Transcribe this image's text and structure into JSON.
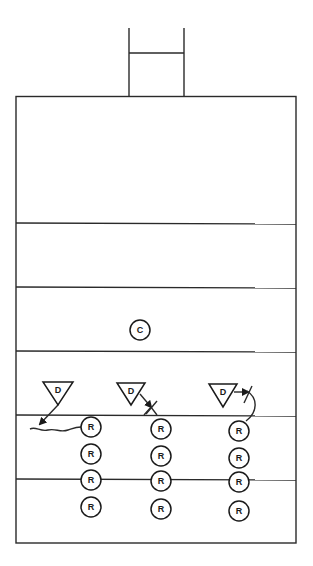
{
  "diagram": {
    "type": "football-drill-diagram",
    "goalpost": {
      "left_x": 129,
      "right_x": 184,
      "top_y": 28,
      "crossbar_y": 53,
      "base_y": 96
    },
    "field": {
      "x": 16,
      "y": 96,
      "width": 280,
      "height": 447
    },
    "yard_lines_y": [
      223,
      287,
      351,
      415,
      479
    ],
    "coach": {
      "label": "C",
      "x": 140,
      "y": 330
    },
    "defenders": [
      {
        "label": "D",
        "x": 58,
        "top_y": 382,
        "half_width": 15,
        "apex_y": 405,
        "technique": "dive-under"
      },
      {
        "label": "D",
        "x": 131,
        "top_y": 383,
        "half_width": 14,
        "apex_y": 405,
        "technique": "block-contact"
      },
      {
        "label": "D",
        "x": 223,
        "top_y": 384,
        "half_width": 14,
        "apex_y": 407,
        "technique": "loop-around"
      }
    ],
    "runner_columns": [
      {
        "x": 91,
        "rows": [
          {
            "label": "R",
            "y": 427
          },
          {
            "label": "R",
            "y": 454
          },
          {
            "label": "R",
            "y": 480
          },
          {
            "label": "R",
            "y": 507
          }
        ]
      },
      {
        "x": 161,
        "rows": [
          {
            "label": "R",
            "y": 429
          },
          {
            "label": "R",
            "y": 456
          },
          {
            "label": "R",
            "y": 481
          },
          {
            "label": "R",
            "y": 509
          }
        ]
      },
      {
        "x": 239,
        "rows": [
          {
            "label": "R",
            "y": 431
          },
          {
            "label": "R",
            "y": 458
          },
          {
            "label": "R",
            "y": 482
          },
          {
            "label": "R",
            "y": 511
          }
        ]
      }
    ],
    "colors": {
      "line": "#2a2a2a",
      "background": "#ffffff"
    }
  }
}
